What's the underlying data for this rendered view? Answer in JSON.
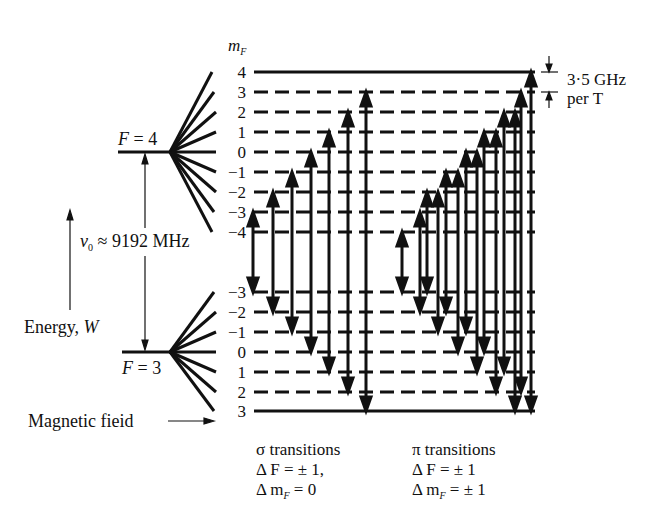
{
  "diagram": {
    "mF_header": "m",
    "mF_header_sub": "F",
    "upper_level": {
      "label_var": "F",
      "label_eq": " = 4",
      "mF_values": [
        "4",
        "3",
        "2",
        "1",
        "0",
        "−1",
        "−2",
        "−3",
        "−4"
      ],
      "y": [
        72,
        92,
        112,
        132,
        152,
        172,
        192,
        212,
        232
      ]
    },
    "lower_level": {
      "label_var": "F",
      "label_eq": " = 3",
      "mF_values": [
        "−3",
        "−2",
        "−1",
        "0",
        "1",
        "2",
        "3"
      ],
      "y": [
        292,
        312,
        332,
        352,
        372,
        392,
        411
      ]
    },
    "splitting": {
      "symbol": "ν",
      "symbol_sub": "0",
      "text": " ≈ 9192 MHz"
    },
    "energy_axis": {
      "label": "Energy, ",
      "label_var": "W"
    },
    "field_axis": {
      "label": "Magnetic fieid"
    },
    "scale_note": {
      "line1": "3·5 GHz",
      "line2": "per  T"
    },
    "legend": {
      "sigma": {
        "title": "σ transitions",
        "rule1": "Δ F = ± 1,",
        "rule2_prefix": "Δ m",
        "rule2_sub": "F",
        "rule2_suffix": " = 0"
      },
      "pi": {
        "title": "π transitions",
        "rule1": "Δ F = ± 1",
        "rule2_prefix": "Δ m",
        "rule2_sub": "F",
        "rule2_suffix": " = ± 1"
      }
    },
    "sigma_transitions": [
      {
        "mF": "-3",
        "x": 253
      },
      {
        "mF": "-2",
        "x": 273
      },
      {
        "mF": "-1",
        "x": 292
      },
      {
        "mF": "0",
        "x": 311
      },
      {
        "mF": "1",
        "x": 329
      },
      {
        "mF": "2",
        "x": 348
      },
      {
        "mF": "3",
        "x": 366
      }
    ],
    "pi_transitions_count": 14,
    "colors": {
      "ink": "#111111",
      "background": "#ffffff"
    }
  }
}
